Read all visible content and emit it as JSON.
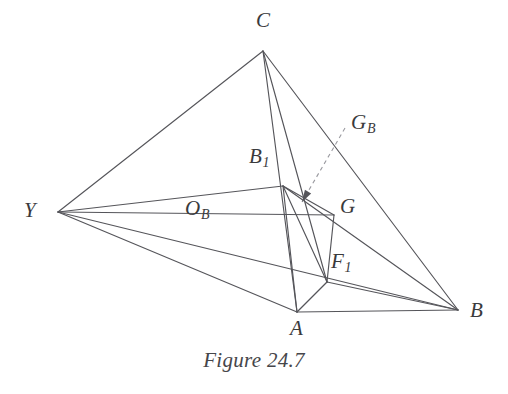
{
  "figure": {
    "caption": "Figure 24.7",
    "stroke_color": "#55555a",
    "dashed_color": "#9a9aa0",
    "label_color": "#3a3a3c",
    "background": "#ffffff",
    "vertices": [
      {
        "id": "C",
        "name": "C",
        "label": "C",
        "sub": "",
        "x": 263,
        "y": 51,
        "lx": 256,
        "ly": 10
      },
      {
        "id": "Y",
        "name": "Y",
        "label": "Y",
        "sub": "",
        "x": 58,
        "y": 212,
        "lx": 24,
        "ly": 200
      },
      {
        "id": "A",
        "name": "A",
        "label": "A",
        "sub": "",
        "x": 297,
        "y": 312,
        "lx": 290,
        "ly": 318
      },
      {
        "id": "B",
        "name": "B",
        "label": "B",
        "sub": "",
        "x": 458,
        "y": 310,
        "lx": 470,
        "ly": 300
      },
      {
        "id": "B1",
        "name": "B1",
        "label": "B",
        "sub": "1",
        "x": 283,
        "y": 186,
        "lx": 249,
        "ly": 146
      },
      {
        "id": "OB",
        "name": "OB",
        "label": "O",
        "sub": "B",
        "x": 208,
        "y": 191,
        "lx": 185,
        "ly": 198
      },
      {
        "id": "G",
        "name": "G",
        "label": "G",
        "sub": "",
        "x": 334,
        "y": 215,
        "lx": 340,
        "ly": 196
      },
      {
        "id": "GB",
        "name": "GB",
        "label": "G",
        "sub": "B",
        "x": 305,
        "y": 205,
        "lx": 351,
        "ly": 112
      },
      {
        "id": "F1",
        "name": "F1",
        "label": "F",
        "sub": "1",
        "x": 327,
        "y": 282,
        "lx": 331,
        "ly": 251
      }
    ],
    "edges": [
      {
        "name": "edge-C-Y",
        "from": "C",
        "to": "Y"
      },
      {
        "name": "edge-C-B",
        "from": "C",
        "to": "B"
      },
      {
        "name": "edge-C-A",
        "from": "C",
        "to": "A"
      },
      {
        "name": "edge-C-F1",
        "from": "C",
        "to": "F1"
      },
      {
        "name": "edge-Y-B1",
        "from": "Y",
        "to": "B1"
      },
      {
        "name": "edge-Y-G",
        "from": "Y",
        "to": "G"
      },
      {
        "name": "edge-Y-A",
        "from": "Y",
        "to": "A"
      },
      {
        "name": "edge-Y-B",
        "from": "Y",
        "to": "B"
      },
      {
        "name": "edge-A-B",
        "from": "A",
        "to": "B"
      },
      {
        "name": "edge-B1-B",
        "from": "B1",
        "to": "B"
      },
      {
        "name": "edge-B1-A",
        "from": "B1",
        "to": "A"
      },
      {
        "name": "edge-B1-G",
        "from": "B1",
        "to": "G"
      },
      {
        "name": "edge-B1-F1",
        "from": "B1",
        "to": "F1"
      },
      {
        "name": "edge-G-F1",
        "from": "G",
        "to": "F1"
      },
      {
        "name": "edge-A-F1",
        "from": "A",
        "to": "F1"
      },
      {
        "name": "edge-F1-B",
        "from": "F1",
        "to": "B"
      }
    ],
    "pointer": {
      "name": "leader-line-GB",
      "style": "dashed",
      "from_x": 345,
      "from_y": 128,
      "to_x": 302,
      "to_y": 202,
      "arrow": true
    }
  }
}
